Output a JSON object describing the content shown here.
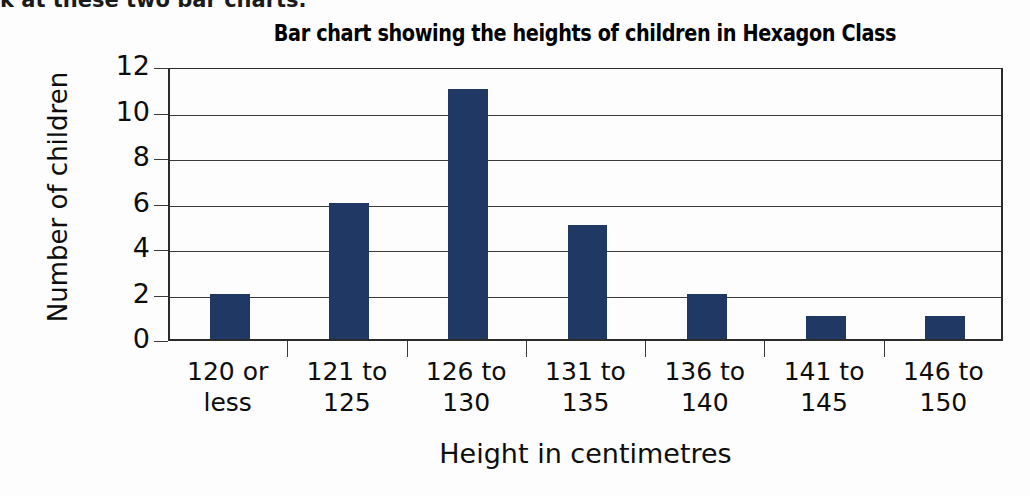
{
  "page": {
    "top_cut_text": "k at these two bar charts."
  },
  "chart_data": {
    "type": "bar",
    "title": "Bar chart showing the heights of children in Hexagon Class",
    "xlabel": "Height in centimetres",
    "ylabel": "Number of children",
    "categories": [
      "120 or less",
      "121 to 125",
      "126 to 130",
      "131 to 135",
      "136 to 140",
      "141 to 145",
      "146 to 150"
    ],
    "category_lines": [
      [
        "120 or",
        "less"
      ],
      [
        "121 to",
        "125"
      ],
      [
        "126 to",
        "130"
      ],
      [
        "131 to",
        "135"
      ],
      [
        "136 to",
        "140"
      ],
      [
        "141 to",
        "145"
      ],
      [
        "146 to",
        "150"
      ]
    ],
    "values": [
      2,
      6,
      11,
      5,
      2,
      1,
      1
    ],
    "ylim": [
      0,
      12
    ],
    "ytick_labels": [
      "0",
      "2",
      "4",
      "6",
      "8",
      "10",
      "12"
    ],
    "ytick_values": [
      0,
      2,
      4,
      6,
      8,
      10,
      12
    ],
    "grid": true,
    "legend": false,
    "bar_color": "#1f3864",
    "axis_color": "#2b2b2b",
    "grid_color": "#3a3a3a",
    "background_color": "#fdfdfd"
  }
}
